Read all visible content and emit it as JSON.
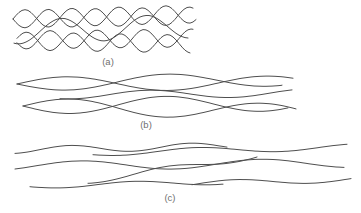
{
  "figure": {
    "background": "#ffffff",
    "line_color": "#4e4e4e",
    "line_width": 1,
    "label_color": "#6f6f6f",
    "label_font_size": 9.5,
    "groups": [
      {
        "id": "a",
        "label": "(a)",
        "label_x": 108,
        "label_y": 65,
        "lines": [
          {
            "x0": 13,
            "x1": 193,
            "y0": 19,
            "y1": 16,
            "amp": 9,
            "wl": 47,
            "ph": 0
          },
          {
            "x0": 13,
            "x1": 196,
            "y0": 19,
            "y1": 14,
            "amp": 9,
            "wl": 47,
            "ph": 3.14
          },
          {
            "x0": 17,
            "x1": 193,
            "y0": 40,
            "y1": 38,
            "amp": 9,
            "wl": 47,
            "ph": 0.3
          },
          {
            "x0": 17,
            "x1": 190,
            "y0": 41,
            "y1": 44,
            "amp": 9,
            "wl": 47,
            "ph": 3.44
          },
          {
            "x0": 14,
            "x1": 188,
            "y0": 32,
            "y1": 26,
            "amp": 12,
            "wl": 85,
            "ph": 1.2
          }
        ]
      },
      {
        "id": "b",
        "label": "(b)",
        "label_x": 146,
        "label_y": 128,
        "lines": [
          {
            "x0": 17,
            "x1": 282,
            "y0": 84,
            "y1": 79,
            "amp": 7,
            "wl": 200,
            "ph": 0
          },
          {
            "x0": 17,
            "x1": 293,
            "y0": 84,
            "y1": 83,
            "amp": 7,
            "wl": 200,
            "ph": 3.14
          },
          {
            "x0": 60,
            "x1": 292,
            "y0": 95,
            "y1": 93,
            "amp": 4,
            "wl": 160,
            "ph": 1.2
          },
          {
            "x0": 23,
            "x1": 288,
            "y0": 106,
            "y1": 103,
            "amp": 8,
            "wl": 190,
            "ph": 0
          },
          {
            "x0": 23,
            "x1": 296,
            "y0": 106,
            "y1": 112,
            "amp": 8,
            "wl": 190,
            "ph": 3.14
          }
        ]
      },
      {
        "id": "c",
        "label": "(c)",
        "label_x": 170,
        "label_y": 201,
        "lines": [
          {
            "x0": 15,
            "x1": 227,
            "y0": 150,
            "y1": 146,
            "amp": 3.5,
            "wl": 120,
            "ph": 1.8
          },
          {
            "x0": 93,
            "x1": 347,
            "y0": 153,
            "y1": 147,
            "amp": 3,
            "wl": 160,
            "ph": 0.6
          },
          {
            "x0": 15,
            "x1": 344,
            "y0": 166,
            "y1": 163,
            "amp": 4.5,
            "wl": 180,
            "ph": 2.4
          },
          {
            "x0": 88,
            "x1": 257,
            "y0": 181,
            "y1": 156,
            "amp": 3,
            "wl": 130,
            "ph": 0.9
          },
          {
            "x0": 30,
            "x1": 223,
            "y0": 186,
            "y1": 182,
            "amp": 2.5,
            "wl": 150,
            "ph": 0.3
          },
          {
            "x0": 192,
            "x1": 351,
            "y0": 184,
            "y1": 179,
            "amp": 3,
            "wl": 150,
            "ph": 2.9
          }
        ]
      }
    ]
  }
}
